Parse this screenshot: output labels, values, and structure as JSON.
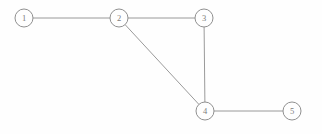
{
  "diagram": {
    "kind": "undirected-graph",
    "title": "",
    "canvas": {
      "width": 322,
      "height": 134,
      "background": "#fefefe"
    },
    "style": {
      "node_radius": 9,
      "node_fill": "#fefefe",
      "node_stroke": "#8a8a8a",
      "node_stroke_width": 0.95,
      "edge_stroke": "#8f8f8f",
      "edge_stroke_width": 0.9,
      "label_color": "#7c7c7c",
      "label_font_size": 8.5
    },
    "nodes": [
      {
        "id": "1",
        "label": "1",
        "cx": 24,
        "cy": 18,
        "r": 9
      },
      {
        "id": "2",
        "label": "2",
        "cx": 119,
        "cy": 18,
        "r": 9
      },
      {
        "id": "3",
        "label": "3",
        "cx": 204,
        "cy": 18,
        "r": 9
      },
      {
        "id": "4",
        "label": "4",
        "cx": 205,
        "cy": 111,
        "r": 9
      },
      {
        "id": "5",
        "label": "5",
        "cx": 292,
        "cy": 111,
        "r": 9
      }
    ],
    "edges": [
      {
        "id": "e1",
        "source": "1",
        "target": "2",
        "label": ""
      },
      {
        "id": "e2",
        "source": "2",
        "target": "3",
        "label": ""
      },
      {
        "id": "e3",
        "source": "2",
        "target": "4",
        "label": ""
      },
      {
        "id": "e4",
        "source": "3",
        "target": "4",
        "label": ""
      },
      {
        "id": "e5",
        "source": "4",
        "target": "5",
        "label": ""
      }
    ]
  }
}
